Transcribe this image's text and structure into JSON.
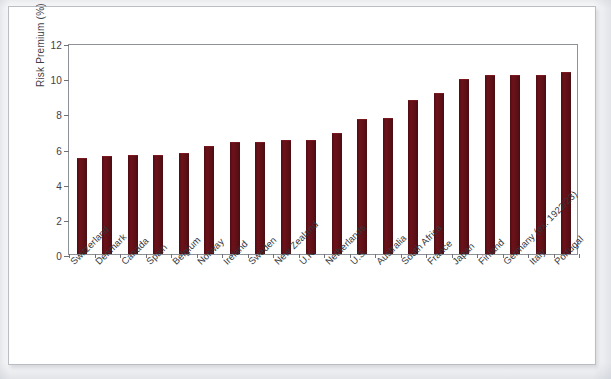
{
  "chart_data": {
    "type": "bar",
    "title": "",
    "subtitle": "",
    "xlabel": "",
    "ylabel": "Risk Premium (%)",
    "ylim": [
      0,
      12
    ],
    "ytick_labels": [
      "0",
      "2",
      "4",
      "6",
      "8",
      "10",
      "12"
    ],
    "ytick_values": [
      0,
      2,
      4,
      6,
      8,
      10,
      12
    ],
    "grid": false,
    "legend": null,
    "bar_color": "#5d1016",
    "categories": [
      "Switzerland",
      "Denmark",
      "Canada",
      "Spain",
      "Belgium",
      "Norway",
      "Ireland",
      "Sweden",
      "New Zealand",
      "U.K.",
      "Netherlands",
      "U.S.",
      "Australia",
      "South Africa",
      "France",
      "Japan",
      "Finland",
      "Germany (ex. 1922/23)",
      "Italy",
      "Portugal"
    ],
    "values": [
      5.4,
      5.5,
      5.6,
      5.6,
      5.7,
      6.1,
      6.3,
      6.3,
      6.4,
      6.4,
      6.8,
      7.6,
      7.7,
      8.7,
      9.1,
      9.9,
      10.1,
      10.1,
      10.1,
      10.3
    ]
  }
}
